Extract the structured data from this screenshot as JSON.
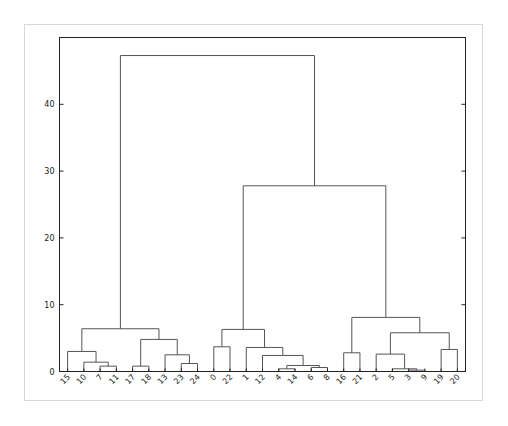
{
  "chart_data": {
    "type": "dendrogram",
    "title": "",
    "xlabel": "",
    "ylabel": "",
    "ylim": [
      0,
      50
    ],
    "yticks": [
      0,
      10,
      20,
      30,
      40
    ],
    "grid": false,
    "leaves": [
      "15",
      "10",
      "7",
      "11",
      "17",
      "18",
      "13",
      "23",
      "24",
      "0",
      "22",
      "1",
      "12",
      "4",
      "14",
      "6",
      "8",
      "16",
      "21",
      "2",
      "5",
      "3",
      "9",
      "19",
      "20"
    ],
    "merges": [
      {
        "left": "7",
        "right": "11",
        "height": 0.8
      },
      {
        "left": "10",
        "right": "(7,11)",
        "height": 1.4
      },
      {
        "left": "15",
        "right": "(10,7,11)",
        "height": 3.0
      },
      {
        "left": "17",
        "right": "18",
        "height": 0.8
      },
      {
        "left": "23",
        "right": "24",
        "height": 1.2
      },
      {
        "left": "13",
        "right": "(23,24)",
        "height": 2.5
      },
      {
        "left": "(17,18)",
        "right": "(13,23,24)",
        "height": 4.8
      },
      {
        "left": "(15,10,7,11)",
        "right": "(17,18,13,23,24)",
        "height": 6.4
      },
      {
        "left": "0",
        "right": "22",
        "height": 3.7
      },
      {
        "left": "4",
        "right": "14",
        "height": 0.4
      },
      {
        "left": "6",
        "right": "8",
        "height": 0.6
      },
      {
        "left": "(4,14)",
        "right": "(6,8)",
        "height": 0.9
      },
      {
        "left": "12",
        "right": "(4,14,6,8)",
        "height": 2.4
      },
      {
        "left": "1",
        "right": "(12,4,14,6,8)",
        "height": 3.6
      },
      {
        "left": "(0,22)",
        "right": "(1,12,4,14,6,8)",
        "height": 6.3
      },
      {
        "left": "16",
        "right": "21",
        "height": 2.8
      },
      {
        "left": "3",
        "right": "9",
        "height": 0.2
      },
      {
        "left": "5",
        "right": "(3,9)",
        "height": 0.4
      },
      {
        "left": "2",
        "right": "(5,3,9)",
        "height": 2.6
      },
      {
        "left": "19",
        "right": "20",
        "height": 3.3
      },
      {
        "left": "(2,5,3,9)",
        "right": "(19,20)",
        "height": 5.8
      },
      {
        "left": "(16,21)",
        "right": "(2,5,3,9,19,20)",
        "height": 8.1
      },
      {
        "left": "(0,22,1,12,4,14,6,8)",
        "right": "(16,21,2,5,3,9,19,20)",
        "height": 27.8
      },
      {
        "left": "(15,10,7,11,17,18,13,23,24)",
        "right": "(0,22,1,12,4,14,6,8,16,21,2,5,3,9,19,20)",
        "height": 47.3
      }
    ],
    "colors": {
      "links": "#555555",
      "axes": "#222222",
      "frame": "#d8d8d8"
    }
  }
}
